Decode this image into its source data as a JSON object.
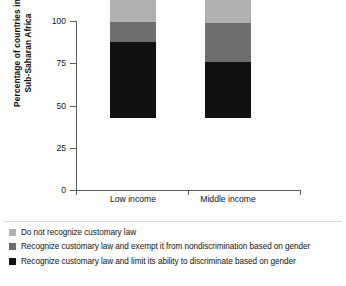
{
  "chart_data": {
    "type": "bar",
    "subtype": "stacked-bar-100",
    "title": "",
    "xlabel": "",
    "ylabel": "Percentage of countries in Sub-Saharan Africa",
    "ylabel_lines": [
      "Percentage of countries in",
      "Sub-Saharan Africa"
    ],
    "categories": [
      "Low income",
      "Middle income"
    ],
    "ylim": [
      0,
      100
    ],
    "yticks": [
      0,
      25,
      50,
      75,
      100
    ],
    "ytick_labels": [
      "0",
      "25",
      "50",
      "75",
      "100"
    ],
    "grid": false,
    "legend_position": "bottom",
    "series": [
      {
        "name": "Recognize customary law and limit its ability to discriminate based on gender",
        "color": "#111111",
        "values": [
          45,
          33
        ]
      },
      {
        "name": "Recognize customary law and exempt it from nondiscrimination based on gender",
        "color": "#6e6e6e",
        "values": [
          12,
          23
        ]
      },
      {
        "name": "Do not recognize customary law",
        "color": "#b0b0b0",
        "values": [
          43,
          44
        ]
      }
    ],
    "stack_boundaries": {
      "Low income": [
        0,
        45,
        57,
        100
      ],
      "Middle income": [
        0,
        33,
        56,
        100
      ]
    }
  },
  "legend": {
    "items": [
      {
        "label": "Do not recognize customary law",
        "color": "#b0b0b0"
      },
      {
        "label": "Recognize customary law and exempt it from nondiscrimination based on gender",
        "color": "#6e6e6e"
      },
      {
        "label": "Recognize customary law and limit its ability to discriminate based on gender",
        "color": "#111111"
      }
    ]
  },
  "colors": {
    "light_gray": "#b0b0b0",
    "mid_gray": "#6e6e6e",
    "black": "#111111",
    "axis": "#5d5d5d",
    "background": "#fdfdfb"
  }
}
